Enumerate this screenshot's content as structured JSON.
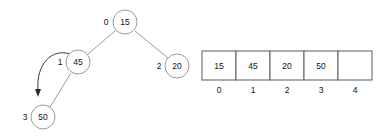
{
  "diagram": {
    "background_color": "#ffffff",
    "node_stroke_color": "#9a9a9a",
    "edge_color": "#8f8f8f",
    "cell_stroke_color": "#5a5a5a",
    "text_color": "#111111",
    "arrow_color": "#2a2a2a"
  },
  "tree": {
    "nodes": [
      {
        "id": "n0",
        "value": "15",
        "index": "0",
        "cx": 125,
        "cy": 22,
        "r": 12,
        "index_x": 106,
        "index_y": 22
      },
      {
        "id": "n1",
        "value": "45",
        "index": "1",
        "cx": 78,
        "cy": 62,
        "r": 12,
        "index_x": 60,
        "index_y": 62
      },
      {
        "id": "n2",
        "value": "20",
        "index": "2",
        "cx": 177,
        "cy": 66,
        "r": 12,
        "index_x": 159,
        "index_y": 66
      },
      {
        "id": "n3",
        "value": "50",
        "index": "3",
        "cx": 43,
        "cy": 117,
        "r": 12,
        "index_x": 25,
        "index_y": 117
      }
    ],
    "edges": [
      {
        "id": "e-root-left",
        "from": "n0",
        "to": "n1",
        "x1": 115,
        "y1": 31,
        "x2": 88,
        "y2": 54
      },
      {
        "id": "e-root-right",
        "from": "n0",
        "to": "n2",
        "x1": 135,
        "y1": 31,
        "x2": 168,
        "y2": 58
      },
      {
        "id": "e-left-child",
        "from": "n1",
        "to": "n3",
        "x1": 71,
        "y1": 73,
        "x2": 50,
        "y2": 107
      }
    ],
    "pointer_arrow": {
      "id": "insert-pointer",
      "label": "",
      "path": "M 70 54 C 52 48 36 64 38 90",
      "head_x": 38,
      "head_y": 96
    }
  },
  "array": {
    "label": "",
    "origin_x": 202,
    "origin_y": 51,
    "cell_width": 34,
    "cell_height": 29,
    "index_row_y": 90,
    "cells": [
      {
        "index": "0",
        "value": "15"
      },
      {
        "index": "1",
        "value": "45"
      },
      {
        "index": "2",
        "value": "20"
      },
      {
        "index": "3",
        "value": "50"
      },
      {
        "index": "4",
        "value": ""
      }
    ]
  }
}
